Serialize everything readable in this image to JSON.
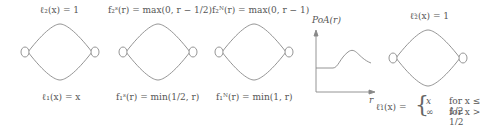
{
  "panels": [
    {
      "id": "g1",
      "top_label": "ℓ₂(x) = 1",
      "bottom_label": "ℓ₁(x) = x"
    },
    {
      "id": "g2",
      "top_label": "f₂ˢ(r) = max(0, r − 1/2)",
      "bottom_label": "f₁ˢ(r) = min(1/2, r)"
    },
    {
      "id": "g3",
      "top_label": "f₂ᴺ(r) = max(0, r − 1)",
      "bottom_label": "f₁ᴺ(r) = min(1, r)"
    },
    {
      "id": "plot",
      "ylabel": "PoA(r)",
      "xlabel": "r"
    },
    {
      "id": "g4",
      "top_label": "ℓ̃₂(x) = 1",
      "bottom_label_lhs": "ℓ̃₁(x) =",
      "cases": [
        {
          "value": "x",
          "condition": "for x ≤ 1/2"
        },
        {
          "value": "∞",
          "condition": "for x > 1/2"
        }
      ]
    }
  ]
}
